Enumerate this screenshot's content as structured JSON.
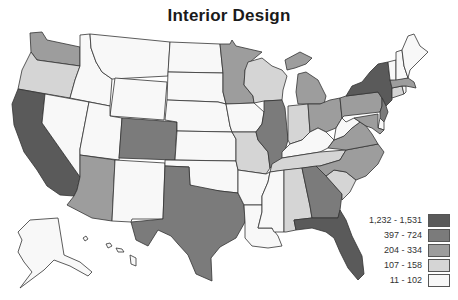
{
  "title": "Interior Design",
  "legend": {
    "bins": [
      {
        "label": "1,232 - 1,531",
        "color": "#5a5a5a"
      },
      {
        "label": "397 - 724",
        "color": "#7b7b7b"
      },
      {
        "label": "204 - 334",
        "color": "#9d9d9d"
      },
      {
        "label": "107 - 158",
        "color": "#d5d5d5"
      },
      {
        "label": "11 - 102",
        "color": "#f8f8f8"
      }
    ]
  },
  "states": {
    "CA": 0,
    "NY": 0,
    "FL": 0,
    "CO": 1,
    "TX": 1,
    "IL": 1,
    "GA": 1,
    "NJ": 1,
    "WA": 2,
    "MN": 2,
    "MI": 2,
    "OH": 2,
    "PA": 2,
    "NC": 2,
    "VA": 2,
    "AZ": 2,
    "MA": 2,
    "MD": 2,
    "OR": 3,
    "WI": 3,
    "IN": 3,
    "MO": 3,
    "TN": 3,
    "SC": 3,
    "AL": 3,
    "CT": 3,
    "ID": 4,
    "MT": 4,
    "WY": 4,
    "NV": 4,
    "UT": 4,
    "NM": 4,
    "ND": 4,
    "SD": 4,
    "NE": 4,
    "KS": 4,
    "OK": 4,
    "IA": 4,
    "AR": 4,
    "LA": 4,
    "MS": 4,
    "KY": 4,
    "WV": 4,
    "ME": 4,
    "NH": 4,
    "VT": 4,
    "RI": 4,
    "DE": 4,
    "AK": 4,
    "HI": 4
  }
}
